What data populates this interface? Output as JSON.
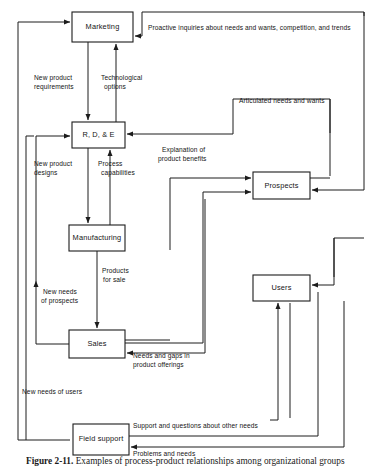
{
  "figure": {
    "caption_label": "Figure 2-11.",
    "caption_text": "Examples of process-product relationships among organizational groups"
  },
  "nodes": [
    {
      "id": "marketing",
      "label": "Marketing",
      "x": 72,
      "y": 12,
      "w": 61,
      "h": 30
    },
    {
      "id": "rde",
      "label": "R, D, & E",
      "x": 72,
      "y": 122,
      "w": 53,
      "h": 26
    },
    {
      "id": "manufacturing",
      "label": "Manufacturing",
      "x": 69,
      "y": 225,
      "w": 56,
      "h": 26
    },
    {
      "id": "sales",
      "label": "Sales",
      "x": 69,
      "y": 330,
      "w": 56,
      "h": 28
    },
    {
      "id": "field_support",
      "label": "Field  support",
      "x": 73,
      "y": 424,
      "w": 56,
      "h": 31
    },
    {
      "id": "prospects",
      "label": "Prospects",
      "x": 253,
      "y": 172,
      "w": 57,
      "h": 27
    },
    {
      "id": "users",
      "label": "Users",
      "x": 253,
      "y": 275,
      "w": 57,
      "h": 26
    }
  ],
  "edges": [
    {
      "id": "proactive-inquiries",
      "label_lines": [
        "Proactive inquiries about needs and wants, competition, and trends"
      ],
      "label_x": 148,
      "label_y": 30,
      "anchor": "start"
    },
    {
      "id": "articulated-needs",
      "label_lines": [
        "Articulated needs and wants"
      ],
      "label_x": 239,
      "label_y": 103,
      "anchor": "start"
    },
    {
      "id": "new-product-requirements",
      "label_lines": [
        "New product",
        "requirements"
      ],
      "label_x": 34,
      "label_y": 80,
      "anchor": "start"
    },
    {
      "id": "technological-options",
      "label_lines": [
        "Technological",
        "options"
      ],
      "label_x": 101,
      "label_y": 80,
      "anchor": "start"
    },
    {
      "id": "new-product-designs",
      "label_lines": [
        "New product",
        "designs"
      ],
      "label_x": 34,
      "label_y": 166,
      "anchor": "start"
    },
    {
      "id": "process-capabilities",
      "label_lines": [
        "Process",
        "capabilities"
      ],
      "label_x": 98,
      "label_y": 166,
      "anchor": "start"
    },
    {
      "id": "explanation-benefits",
      "label_lines": [
        "Explanation of",
        "product benefits"
      ],
      "label_x": 160,
      "label_y": 152,
      "anchor": "start"
    },
    {
      "id": "products-for-sale",
      "label_lines": [
        "Products",
        "for sale"
      ],
      "label_x": 101,
      "label_y": 273,
      "anchor": "start"
    },
    {
      "id": "new-needs-prospects",
      "label_lines": [
        "New needs",
        "of prospects"
      ],
      "label_x": 41,
      "label_y": 294,
      "anchor": "start"
    },
    {
      "id": "needs-and-gaps",
      "label_lines": [
        "Needs and gaps in",
        "product offerings"
      ],
      "label_x": 133,
      "label_y": 358,
      "anchor": "start"
    },
    {
      "id": "new-needs-users",
      "label_lines": [
        "New needs of users"
      ],
      "label_x": 22,
      "label_y": 394,
      "anchor": "start"
    },
    {
      "id": "support-questions",
      "label_lines": [
        "Support and questions about other needs"
      ],
      "label_x": 133,
      "label_y": 428,
      "anchor": "start"
    },
    {
      "id": "problems-and-needs",
      "label_lines": [
        "Problems and needs"
      ],
      "label_x": 133,
      "label_y": 456,
      "anchor": "start"
    }
  ],
  "colors": {
    "stroke": "#1c1c1c",
    "text": "#141414",
    "background": "#ffffff"
  }
}
